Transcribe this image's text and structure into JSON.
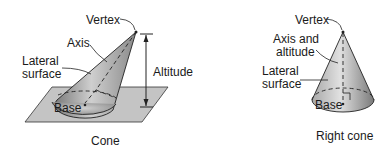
{
  "figures": [
    {
      "caption": "Cone",
      "labels": {
        "vertex": "Vertex",
        "axis": "Axis",
        "lateral_1": "Lateral",
        "lateral_2": "surface",
        "base": "Base",
        "altitude": "Altitude"
      }
    },
    {
      "caption": "Right cone",
      "labels": {
        "vertex": "Vertex",
        "axis_1": "Axis and",
        "axis_2": "altitude",
        "lateral_1": "Lateral",
        "lateral_2": "surface",
        "base": "Base"
      }
    }
  ],
  "colors": {
    "plane": "#bdbdbd",
    "cone_dark": "#6e6e6e",
    "cone_light": "#d8d8d8",
    "line": "#1a1a1a"
  }
}
